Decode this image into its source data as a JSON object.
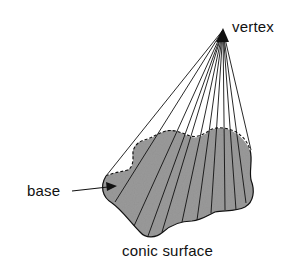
{
  "diagram": {
    "title": "Conic surface",
    "labels": {
      "vertex": "vertex",
      "base": "base",
      "surface": "conic surface"
    },
    "colors": {
      "base_fill": "#9a9a9a",
      "outline": "#111111",
      "background": "#ffffff"
    },
    "elements": {
      "vertex_point": [
        223,
        30
      ],
      "generator_line_count": 12,
      "base_shape": "irregular closed curve (blob)",
      "arrow_from": "base label",
      "arrow_to": "base region"
    }
  }
}
